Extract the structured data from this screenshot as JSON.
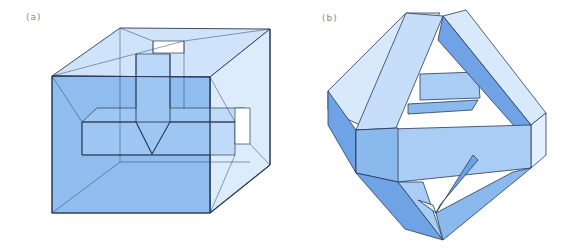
{
  "figure": {
    "panels": [
      {
        "id": "a",
        "label": "(a)",
        "description": "Transparent cube containing an inner cube connected by edges (tesseract projection) with a notch"
      },
      {
        "id": "b",
        "label": "(b)",
        "description": "Interlocking rectangular bands forming an octahedral frame"
      }
    ]
  },
  "colors": {
    "face_dark": "#7fb0ea",
    "face_mid": "#a9cdf5",
    "face_light": "#d7e9fb",
    "edge": "#2a3a55"
  }
}
